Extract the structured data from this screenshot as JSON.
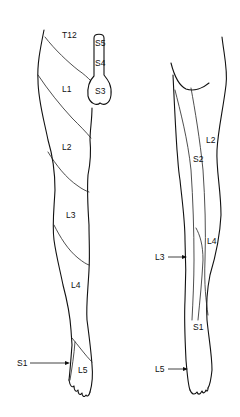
{
  "diagram": {
    "type": "dermatome-map",
    "views": [
      {
        "name": "anterior-leg",
        "labels": {
          "t12": "T12",
          "s5": "S5",
          "s4": "S4",
          "s3": "S3",
          "l1": "L1",
          "l2": "L2",
          "l3": "L3",
          "l4": "L4",
          "l5": "L5",
          "s1": "S1"
        }
      },
      {
        "name": "posterior-leg",
        "labels": {
          "l2": "L2",
          "s2": "S2",
          "l3": "L3",
          "l4": "L4",
          "s1": "S1",
          "l5": "L5"
        }
      }
    ],
    "colors": {
      "line": "#111111",
      "background": "#ffffff"
    }
  }
}
